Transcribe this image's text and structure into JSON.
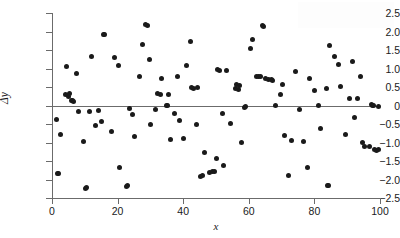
{
  "chart_data": {
    "type": "scatter",
    "title": "",
    "xlabel": "x",
    "ylabel": "Δy",
    "xlim": [
      0,
      100
    ],
    "ylim": [
      -2.5,
      2.5
    ],
    "xticks": [
      0,
      20,
      40,
      60,
      80,
      100
    ],
    "xtick_labels": [
      "0",
      "20",
      "40",
      "60",
      "80",
      "100"
    ],
    "yticks": [
      2.5,
      2.0,
      1.5,
      1.0,
      0.5,
      0,
      -0.5,
      -1.0,
      -1.5,
      -2.0,
      -2.5
    ],
    "ytick_labels": [
      "2.5",
      "2.0",
      "1.5",
      "1.0",
      "0.5",
      "0",
      "−0.5",
      "−1.0",
      "−1.5",
      "−2.0",
      "−2.5"
    ],
    "grid": false,
    "legend": null,
    "reference_line_y": 0,
    "marker": "filled-circle",
    "marker_color": "#1a1a1a",
    "axis_color": "#6b6b6b",
    "background_color": "#ffffff",
    "n_points": 120,
    "points": [
      [
        1.3,
        -0.37
      ],
      [
        1.6,
        -1.85
      ],
      [
        2.6,
        -0.78
      ],
      [
        4.2,
        0.3
      ],
      [
        4.5,
        1.05
      ],
      [
        5.0,
        0.25
      ],
      [
        5.8,
        0.14
      ],
      [
        6.2,
        0.13
      ],
      [
        7.6,
        0.87
      ],
      [
        8.0,
        -0.17
      ],
      [
        9.6,
        -0.98
      ],
      [
        10.1,
        -2.23
      ],
      [
        11.4,
        -0.17
      ],
      [
        12.1,
        1.32
      ],
      [
        13.3,
        -0.53
      ],
      [
        14.3,
        -0.14
      ],
      [
        15.2,
        -0.44
      ],
      [
        15.8,
        1.92
      ],
      [
        18.0,
        -0.69
      ],
      [
        19.2,
        1.31
      ],
      [
        20.3,
        1.08
      ],
      [
        20.6,
        -1.68
      ],
      [
        22.6,
        -2.18
      ],
      [
        23.6,
        -0.07
      ],
      [
        24.4,
        -0.25
      ],
      [
        25.0,
        -0.83
      ],
      [
        26.6,
        0.78
      ],
      [
        27.6,
        1.66
      ],
      [
        28.6,
        2.18
      ],
      [
        29.8,
        1.25
      ],
      [
        30.0,
        -0.51
      ],
      [
        31.6,
        -0.12
      ],
      [
        32.2,
        0.32
      ],
      [
        33.4,
        0.72
      ],
      [
        35.0,
        0.01
      ],
      [
        35.6,
        0.31
      ],
      [
        36.2,
        -0.93
      ],
      [
        37.4,
        -0.22
      ],
      [
        38.2,
        0.79
      ],
      [
        38.8,
        -0.4
      ],
      [
        40.0,
        -0.89
      ],
      [
        41.0,
        1.09
      ],
      [
        42.2,
        1.73
      ],
      [
        42.6,
        0.48
      ],
      [
        44.0,
        -0.51
      ],
      [
        44.4,
        0.49
      ],
      [
        45.2,
        -1.91
      ],
      [
        46.6,
        -1.26
      ],
      [
        48.0,
        -1.8
      ],
      [
        48.8,
        -1.78
      ],
      [
        49.6,
        -1.79
      ],
      [
        50.2,
        -1.42
      ],
      [
        50.6,
        0.96
      ],
      [
        52.0,
        -0.21
      ],
      [
        52.4,
        -1.62
      ],
      [
        53.2,
        0.94
      ],
      [
        54.4,
        -0.48
      ],
      [
        56.0,
        0.45
      ],
      [
        56.4,
        0.58
      ],
      [
        57.2,
        0.55
      ],
      [
        57.8,
        -1.0
      ],
      [
        58.8,
        -0.05
      ],
      [
        60.6,
        1.55
      ],
      [
        61.2,
        1.79
      ],
      [
        62.2,
        0.79
      ],
      [
        63.0,
        0.78
      ],
      [
        64.2,
        2.15
      ],
      [
        65.2,
        0.72
      ],
      [
        66.0,
        0.7
      ],
      [
        67.2,
        0.68
      ],
      [
        68.0,
        -0.01
      ],
      [
        69.6,
        0.3
      ],
      [
        70.4,
        0.57
      ],
      [
        70.8,
        -0.82
      ],
      [
        72.2,
        -1.88
      ],
      [
        73.0,
        -0.95
      ],
      [
        74.2,
        0.93
      ],
      [
        75.4,
        -0.1
      ],
      [
        76.6,
        -0.96
      ],
      [
        77.8,
        -1.68
      ],
      [
        78.6,
        0.72
      ],
      [
        80.0,
        0.41
      ],
      [
        81.4,
        -0.01
      ],
      [
        82.0,
        -0.62
      ],
      [
        83.6,
        0.47
      ],
      [
        84.2,
        -2.16
      ],
      [
        84.6,
        1.63
      ],
      [
        86.0,
        1.32
      ],
      [
        87.2,
        1.1
      ],
      [
        88.0,
        0.51
      ],
      [
        89.4,
        -0.78
      ],
      [
        90.6,
        0.19
      ],
      [
        91.6,
        1.2
      ],
      [
        92.2,
        -0.33
      ],
      [
        93.0,
        0.18
      ],
      [
        94.0,
        0.79
      ],
      [
        94.6,
        -1.0
      ],
      [
        95.4,
        -1.12
      ],
      [
        96.8,
        -1.1
      ],
      [
        97.4,
        0.02
      ],
      [
        97.8,
        0.0
      ],
      [
        98.4,
        -1.19
      ],
      [
        99.0,
        -1.21
      ],
      [
        99.4,
        -0.02
      ],
      [
        29.0,
        2.17
      ],
      [
        16.0,
        1.91
      ],
      [
        64.6,
        2.14
      ],
      [
        45.8,
        -1.9
      ],
      [
        23.0,
        -2.17
      ],
      [
        10.4,
        -2.22
      ],
      [
        84.0,
        -2.15
      ],
      [
        2.0,
        -1.84
      ],
      [
        56.8,
        0.44
      ],
      [
        63.6,
        0.79
      ],
      [
        66.8,
        0.69
      ],
      [
        33.0,
        0.3
      ],
      [
        43.0,
        0.47
      ],
      [
        59.0,
        -0.04
      ],
      [
        98.0,
        0.01
      ],
      [
        99.6,
        -1.2
      ],
      [
        5.4,
        0.32
      ],
      [
        6.6,
        0.12
      ],
      [
        35.2,
        0.0
      ],
      [
        51.0,
        0.95
      ]
    ]
  },
  "watermark": {
    "text": ""
  }
}
